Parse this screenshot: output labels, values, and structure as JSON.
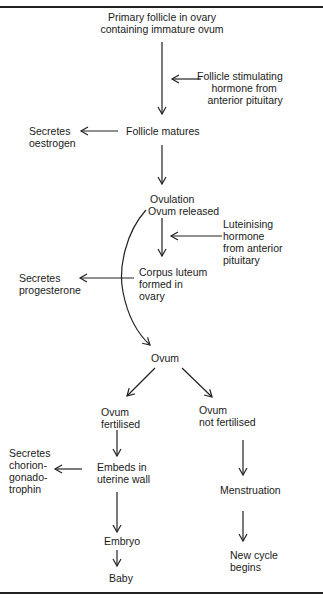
{
  "diagram": {
    "nodes": {
      "primary_follicle": {
        "lines": [
          "Primary follicle in ovary",
          "containing immature ovum"
        ]
      },
      "fsh": {
        "lines": [
          "Follicle stimulating",
          "hormone from",
          "anterior pituitary"
        ]
      },
      "follicle_matures": {
        "lines": [
          "Follicle matures"
        ]
      },
      "secretes_oestrogen": {
        "lines": [
          "Secretes",
          "oestrogen"
        ]
      },
      "ovulation": {
        "lines": [
          "Ovulation",
          "Ovum released"
        ]
      },
      "lh": {
        "lines": [
          "Luteinising",
          "hormone",
          "from anterior",
          "pituitary"
        ]
      },
      "corpus_luteum": {
        "lines": [
          "Corpus luteum",
          "formed in",
          "ovary"
        ]
      },
      "secretes_progesterone": {
        "lines": [
          "Secretes",
          "progesterone"
        ]
      },
      "ovum": {
        "lines": [
          "Ovum"
        ]
      },
      "ovum_fertilised": {
        "lines": [
          "Ovum",
          "fertilised"
        ]
      },
      "ovum_not_fertilised": {
        "lines": [
          "Ovum",
          "not fertilised"
        ]
      },
      "embeds": {
        "lines": [
          "Embeds in",
          "uterine wall"
        ]
      },
      "secretes_hcg": {
        "lines": [
          "Secretes",
          "chorion-",
          "gonado-",
          "trophin"
        ]
      },
      "menstruation": {
        "lines": [
          "Menstruation"
        ]
      },
      "embryo": {
        "lines": [
          "Embryo"
        ]
      },
      "new_cycle": {
        "lines": [
          "New cycle",
          "begins"
        ]
      },
      "baby": {
        "lines": [
          "Baby"
        ]
      }
    },
    "edges": [
      {
        "from": "primary_follicle",
        "to": "follicle_matures"
      },
      {
        "from": "fsh",
        "to": "primary_follicle->follicle_matures"
      },
      {
        "from": "follicle_matures",
        "to": "secretes_oestrogen"
      },
      {
        "from": "follicle_matures",
        "to": "ovulation"
      },
      {
        "from": "lh",
        "to": "ovulation->corpus_luteum"
      },
      {
        "from": "ovulation",
        "to": "corpus_luteum"
      },
      {
        "from": "corpus_luteum",
        "to": "secretes_progesterone"
      },
      {
        "from": "ovulation",
        "to": "ovum",
        "style": "curved"
      },
      {
        "from": "ovum",
        "to": "ovum_fertilised"
      },
      {
        "from": "ovum",
        "to": "ovum_not_fertilised"
      },
      {
        "from": "ovum_fertilised",
        "to": "embeds"
      },
      {
        "from": "embeds",
        "to": "secretes_hcg"
      },
      {
        "from": "embeds",
        "to": "embryo"
      },
      {
        "from": "embryo",
        "to": "baby"
      },
      {
        "from": "ovum_not_fertilised",
        "to": "menstruation"
      },
      {
        "from": "menstruation",
        "to": "new_cycle"
      }
    ],
    "colors": {
      "ink": "#222222",
      "background": "#ffffff"
    }
  }
}
